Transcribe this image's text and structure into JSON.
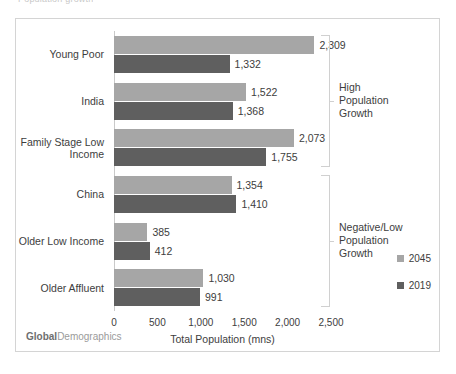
{
  "top_clip_text": "Population growth",
  "chart_data": {
    "type": "bar",
    "orientation": "horizontal",
    "title": "",
    "xlabel": "Total Population (mns)",
    "ylabel": "",
    "xlim": [
      0,
      2500
    ],
    "xticks": [
      "0",
      "500",
      "1,000",
      "1,500",
      "2,000",
      "2,500"
    ],
    "xtick_values": [
      0,
      500,
      1000,
      1500,
      2000,
      2500
    ],
    "grid": false,
    "legend_position": "right-bottom",
    "categories": [
      "Young Poor",
      "India",
      "Family Stage Low Income",
      "China",
      "Older Low Income",
      "Older Affluent"
    ],
    "category_labels": [
      "Young Poor",
      "India",
      "Family Stage Low\nIncome",
      "China",
      "Older Low Income",
      "Older Affluent"
    ],
    "series": [
      {
        "name": "2045",
        "color": "#a6a6a6",
        "values": [
          2309,
          1522,
          2073,
          1354,
          385,
          1030
        ],
        "labels": [
          "2,309",
          "1,522",
          "2,073",
          "1,354",
          "385",
          "1,030"
        ]
      },
      {
        "name": "2019",
        "color": "#5f5f5f",
        "values": [
          1332,
          1368,
          1755,
          1410,
          412,
          991
        ],
        "labels": [
          "1,332",
          "1,368",
          "1,755",
          "1,410",
          "412",
          "991"
        ]
      }
    ],
    "annotations": [
      {
        "text": "High\nPopulation\nGrowth",
        "covers": [
          "Young Poor",
          "India",
          "Family Stage Low Income"
        ]
      },
      {
        "text": "Negative/Low\nPopulation\nGrowth",
        "covers": [
          "China",
          "Older Low Income",
          "Older Affluent"
        ]
      }
    ]
  },
  "watermark": {
    "strong": "Global",
    "normal": "Demographics"
  },
  "legend": {
    "items": [
      {
        "label": "2045",
        "color": "#a6a6a6"
      },
      {
        "label": "2019",
        "color": "#5f5f5f"
      }
    ]
  }
}
